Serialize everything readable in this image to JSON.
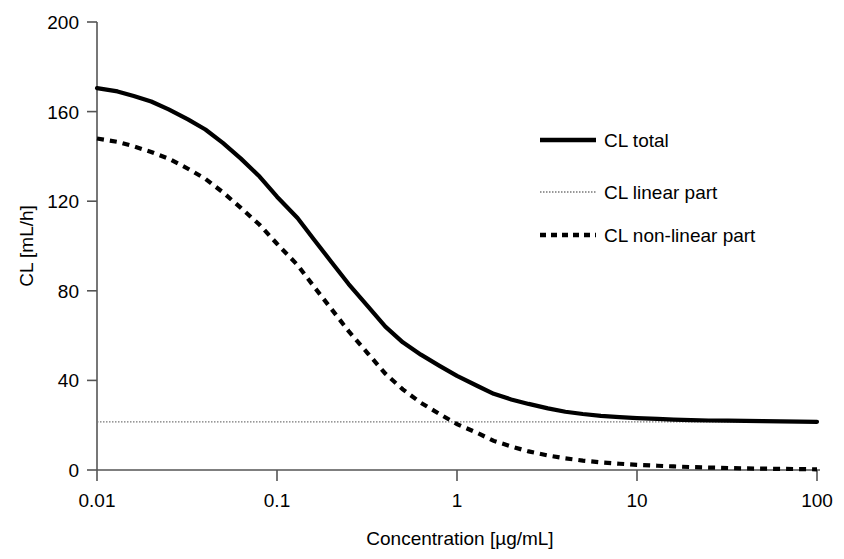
{
  "chart_data": {
    "type": "line",
    "title": "",
    "xlabel": "Concentration [µg/mL]",
    "ylabel": "CL [mL/h]",
    "xscale": "log",
    "xlim": [
      0.01,
      100
    ],
    "ylim": [
      0,
      200
    ],
    "yticks": [
      0,
      40,
      80,
      120,
      160,
      200
    ],
    "ytick_labels": [
      "0",
      "40",
      "80",
      "120",
      "160",
      "200"
    ],
    "xticks": [
      0.01,
      0.1,
      1,
      10,
      100
    ],
    "xtick_labels": [
      "0.01",
      "0.1",
      "1",
      "10",
      "100"
    ],
    "grid": false,
    "legend_position": "upper right",
    "colors": {
      "line": "#000000",
      "axis": "#555555",
      "linear": "#777777"
    },
    "x": [
      0.01,
      0.013,
      0.016,
      0.02,
      0.025,
      0.032,
      0.04,
      0.05,
      0.063,
      0.08,
      0.1,
      0.13,
      0.16,
      0.2,
      0.25,
      0.32,
      0.4,
      0.5,
      0.63,
      0.8,
      1.0,
      1.3,
      1.6,
      2.0,
      2.5,
      3.2,
      4.0,
      5.0,
      6.3,
      8.0,
      10.0,
      13.0,
      16.0,
      20.0,
      25.0,
      32.0,
      40.0,
      50.0,
      63.0,
      80.0,
      100.0
    ],
    "series": [
      {
        "name": "CL total",
        "style": "solid-thick",
        "values": [
          170.5,
          169.0,
          167.0,
          164.5,
          161.0,
          156.5,
          152.0,
          146.0,
          139.0,
          131.0,
          122.0,
          112.5,
          103.0,
          93.0,
          83.0,
          73.0,
          64.0,
          57.0,
          51.5,
          46.5,
          42.0,
          37.5,
          34.0,
          31.5,
          29.5,
          27.5,
          26.0,
          25.0,
          24.2,
          23.6,
          23.2,
          22.8,
          22.5,
          22.3,
          22.1,
          22.0,
          21.9,
          21.8,
          21.7,
          21.6,
          21.5
        ]
      },
      {
        "name": "CL linear part",
        "style": "dotted-thin",
        "values": [
          21.5,
          21.5,
          21.5,
          21.5,
          21.5,
          21.5,
          21.5,
          21.5,
          21.5,
          21.5,
          21.5,
          21.5,
          21.5,
          21.5,
          21.5,
          21.5,
          21.5,
          21.5,
          21.5,
          21.5,
          21.5,
          21.5,
          21.5,
          21.5,
          21.5,
          21.5,
          21.5,
          21.5,
          21.5,
          21.5,
          21.5,
          21.5,
          21.5,
          21.5,
          21.5,
          21.5,
          21.5,
          21.5,
          21.5,
          21.5,
          21.5
        ]
      },
      {
        "name": "CL non-linear part",
        "style": "dashed-thick",
        "values": [
          148.0,
          146.5,
          144.5,
          142.0,
          139.0,
          134.5,
          130.0,
          124.0,
          117.0,
          109.5,
          101.0,
          91.5,
          82.0,
          72.0,
          62.0,
          52.0,
          43.0,
          36.0,
          30.0,
          25.0,
          20.5,
          16.5,
          13.0,
          10.5,
          8.3,
          6.5,
          5.2,
          4.2,
          3.4,
          2.8,
          2.3,
          1.9,
          1.6,
          1.3,
          1.1,
          0.9,
          0.7,
          0.6,
          0.5,
          0.4,
          0.3
        ]
      }
    ]
  },
  "legend": {
    "items": [
      {
        "label": "CL total",
        "style": "solid-thick"
      },
      {
        "label": "CL linear part",
        "style": "dotted-thin"
      },
      {
        "label": "CL non-linear part",
        "style": "dashed-thick"
      }
    ]
  },
  "axes": {
    "y_title": "CL [mL/h]",
    "x_title": "Concentration [µg/mL]",
    "ytick_0": "0",
    "ytick_1": "40",
    "ytick_2": "80",
    "ytick_3": "120",
    "ytick_4": "160",
    "ytick_5": "200",
    "xtick_0": "0.01",
    "xtick_1": "0.1",
    "xtick_2": "1",
    "xtick_3": "10",
    "xtick_4": "100"
  }
}
